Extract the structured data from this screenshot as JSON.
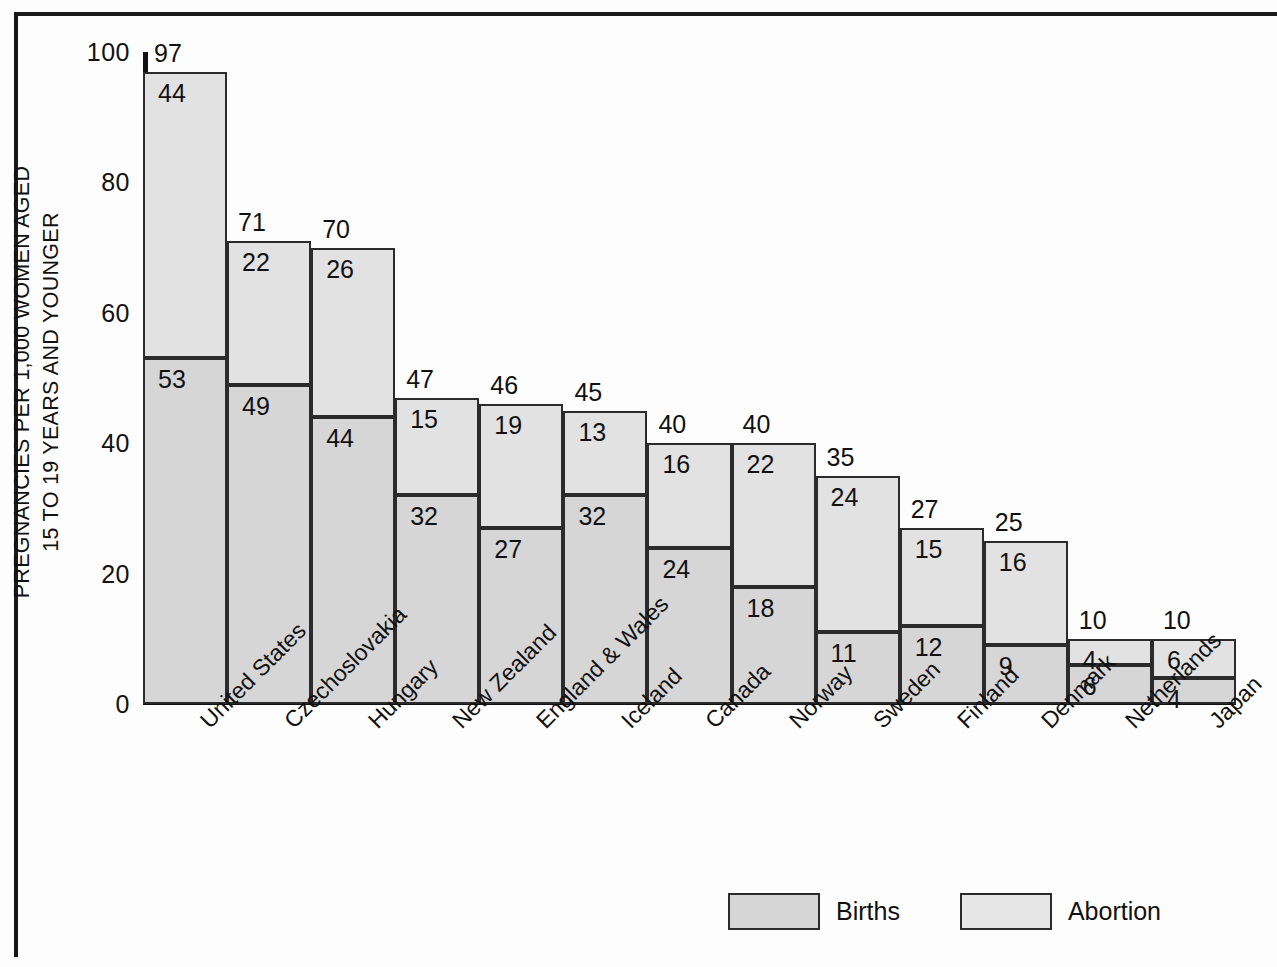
{
  "chart_data": {
    "type": "bar",
    "subtype": "stacked",
    "title": "",
    "xlabel": "",
    "ylabel": "PREGNANCIES PER 1,000 WOMEN AGED 15 TO 19 YEARS AND YOUNGER",
    "ylabel_lines": [
      "PREGNANCIES PER 1,000 WOMEN AGED",
      "15 TO 19 YEARS AND YOUNGER"
    ],
    "ylim": [
      0,
      100
    ],
    "yticks": [
      0,
      20,
      40,
      60,
      80,
      100
    ],
    "ytick_labels": [
      "0",
      "20",
      "40",
      "60",
      "80",
      "100"
    ],
    "grid": false,
    "legend_position": "bottom",
    "categories": [
      "United States",
      "Czechoslovakia",
      "Hungary",
      "New Zealand",
      "England & Wales",
      "Iceland",
      "Canada",
      "Norway",
      "Sweden",
      "Finland",
      "Denmark",
      "Netherlands",
      "Japan"
    ],
    "series": [
      {
        "name": "Births",
        "color": "#d6d6d6",
        "stack_position": "bottom",
        "values": [
          53,
          49,
          44,
          32,
          27,
          32,
          24,
          18,
          11,
          12,
          9,
          6,
          4
        ]
      },
      {
        "name": "Abortion",
        "color": "#e2e2e2",
        "stack_position": "top",
        "values": [
          44,
          22,
          26,
          15,
          19,
          13,
          16,
          22,
          24,
          15,
          16,
          4,
          6
        ]
      }
    ],
    "totals": [
      97,
      71,
      70,
      47,
      46,
      45,
      40,
      40,
      35,
      27,
      25,
      10,
      10
    ],
    "legend": [
      {
        "label": "Births",
        "color": "#d6d6d6"
      },
      {
        "label": "Abortion",
        "color": "#e6e6e6"
      }
    ]
  },
  "style": {
    "axis_color": "#111111",
    "frame_color": "#1a1a1a",
    "bar_outline": "#2b2b2b",
    "background": "#fdfdfd"
  }
}
